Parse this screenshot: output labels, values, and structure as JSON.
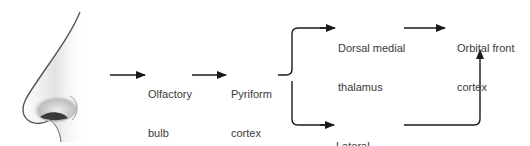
{
  "figure": {
    "image": {
      "name": "nose-illustration"
    },
    "nodes": [
      {
        "id": "olfactory-bulb",
        "lines": [
          "Olfactory",
          "bulb"
        ]
      },
      {
        "id": "pyriform-cortex",
        "lines": [
          "Pyriform",
          "cortex"
        ]
      },
      {
        "id": "dorsal-medial-thalamus",
        "lines": [
          "Dorsal medial",
          "thalamus"
        ]
      },
      {
        "id": "lateral-hypothalamus",
        "lines": [
          "Lateral",
          "hypothalamus"
        ]
      },
      {
        "id": "orbital-front-cortex",
        "lines": [
          "Orbital front",
          "cortex"
        ]
      }
    ],
    "edges": [
      {
        "from": "nose",
        "to": "olfactory-bulb"
      },
      {
        "from": "olfactory-bulb",
        "to": "pyriform-cortex"
      },
      {
        "from": "pyriform-cortex",
        "to": "dorsal-medial-thalamus"
      },
      {
        "from": "pyriform-cortex",
        "to": "lateral-hypothalamus"
      },
      {
        "from": "dorsal-medial-thalamus",
        "to": "orbital-front-cortex"
      },
      {
        "from": "lateral-hypothalamus",
        "to": "orbital-front-cortex"
      }
    ],
    "colors": {
      "line": "#1a1a1a",
      "text": "#3a3a3a"
    }
  }
}
